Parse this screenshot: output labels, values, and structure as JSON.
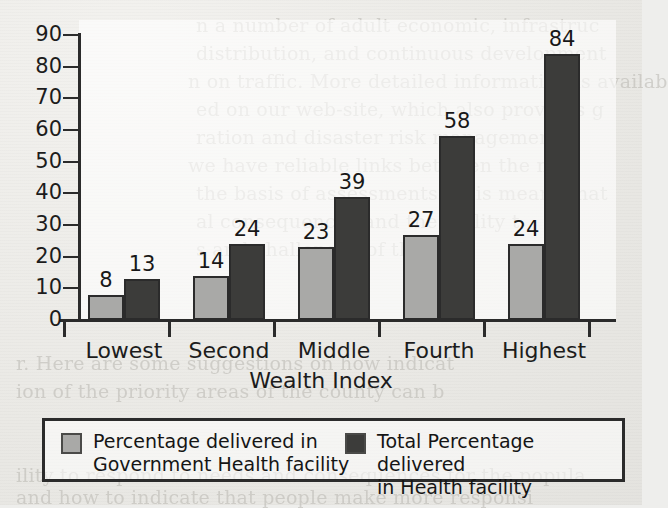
{
  "chart_data": {
    "type": "bar",
    "title": "",
    "xlabel": "Wealth Index",
    "ylabel": "",
    "categories": [
      "Lowest",
      "Second",
      "Middle",
      "Fourth",
      "Highest"
    ],
    "series": [
      {
        "name": "Percentage delivered in\nGovernment Health facility",
        "color": "#a9a9a7",
        "values": [
          8,
          14,
          23,
          27,
          24
        ]
      },
      {
        "name": "Total Percentage delivered\nin Health facility",
        "color": "#3c3c3a",
        "values": [
          13,
          24,
          39,
          58,
          84
        ]
      }
    ],
    "ylim": [
      0,
      90
    ],
    "ytick_step": 10,
    "yticks": [
      0,
      10,
      20,
      30,
      40,
      50,
      60,
      70,
      80,
      90
    ],
    "grid": false,
    "legend_position": "bottom",
    "show_value_labels": true
  },
  "background_text": [
    "n  a number of adult economic, infrastruc",
    "distribution, and continuous development",
    "n on traffic. More detailed information is availab",
    "ed on our web-site, which also provides g",
    "ration and disaster risk management",
    "we have reliable links between the m",
    "the basis of assessments. This means that",
    "al consequences and the ability t",
    "s and challenges of the data",
    "r. Here are some suggestions on how indicat",
    "ion of the priority areas of the county can b",
    "ility to respond to needs and consequences for the popula",
    "and how to indicate that people make more responsi"
  ]
}
